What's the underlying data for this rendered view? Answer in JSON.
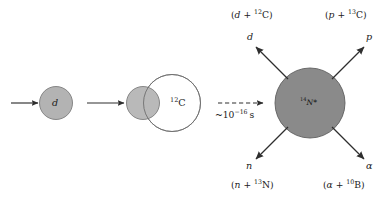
{
  "figure": {
    "type": "nuclear-reaction-diagram",
    "colors": {
      "projectile_fill": "#b3b3b3",
      "target_fill": "#ffffff",
      "target_stroke": "#6e6e6e",
      "nucleus_fill": "#8a8a8a",
      "nucleus_stroke": "#5a5a5a",
      "stroke": "#3a3a3a",
      "text": "#1a1a1a",
      "background": "#ffffff"
    }
  },
  "stage_left": {
    "incoming_arrow": "arrow-right",
    "projectile_label": "d",
    "transition_arrow": "arrow-right"
  },
  "stage_overlap": {
    "projectile_label": "d",
    "target_mass": "12",
    "target_symbol": "C",
    "target_label": "12C"
  },
  "transition": {
    "arrow": "dashed-arrow-right",
    "time_prefix": "~10",
    "time_exponent": "−16",
    "time_unit": "s",
    "time_label": "~10−16 s"
  },
  "compound_nucleus": {
    "mass_number": "14",
    "symbol": "N",
    "excited_marker": "*",
    "label": "14N*"
  },
  "decay_channels": [
    {
      "id": "deuteron-channel",
      "position": "top-left",
      "particle": "d",
      "products_open": "(",
      "products_left": "d",
      "products_plus": " + ",
      "products_mass": "12",
      "products_symbol": "C",
      "products_close": ")",
      "products_label": "(d + 12C)"
    },
    {
      "id": "proton-channel",
      "position": "top-right",
      "particle": "p",
      "products_open": "(",
      "products_left": "p",
      "products_plus": " + ",
      "products_mass": "13",
      "products_symbol": "C",
      "products_close": ")",
      "products_label": "(p + 13C)"
    },
    {
      "id": "neutron-channel",
      "position": "bottom-left",
      "particle": "n",
      "products_open": "(",
      "products_left": "n",
      "products_plus": " + ",
      "products_mass": "13",
      "products_symbol": "N",
      "products_close": ")",
      "products_label": "(n + 13N)"
    },
    {
      "id": "alpha-channel",
      "position": "bottom-right",
      "particle": "α",
      "products_open": "(",
      "products_left": "α",
      "products_plus": " + ",
      "products_mass": "10",
      "products_symbol": "B",
      "products_close": ")",
      "products_label": "(α + 10B)"
    }
  ]
}
